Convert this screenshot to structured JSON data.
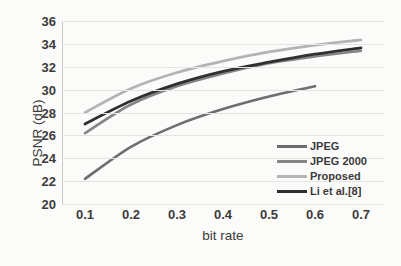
{
  "chart_data": {
    "type": "line",
    "title": "",
    "xlabel": "bit rate",
    "ylabel": "PSNR (dB)",
    "xlim": [
      0.05,
      0.75
    ],
    "ylim": [
      20,
      36
    ],
    "ytick_step": 2,
    "grid": true,
    "legend_position": "bottom-right",
    "xticks": [
      "0.1",
      "0.2",
      "0.3",
      "0.4",
      "0.5",
      "0.6",
      "0.7"
    ],
    "yticks": [
      "36",
      "34",
      "32",
      "30",
      "28",
      "26",
      "24",
      "22",
      "20"
    ],
    "x": [
      0.1,
      0.2,
      0.3,
      0.4,
      0.5,
      0.6,
      0.7
    ],
    "series": [
      {
        "name": "JPEG",
        "color": "#6e6e6e",
        "width": 2.6,
        "x": [
          0.1,
          0.2,
          0.3,
          0.4,
          0.5,
          0.6
        ],
        "values": [
          22.2,
          25.0,
          26.9,
          28.3,
          29.4,
          30.3
        ]
      },
      {
        "name": "JPEG 2000",
        "color": "#858585",
        "width": 2.6,
        "x": [
          0.1,
          0.2,
          0.3,
          0.4,
          0.5,
          0.6,
          0.7
        ],
        "values": [
          26.2,
          28.7,
          30.3,
          31.4,
          32.3,
          32.9,
          33.4
        ]
      },
      {
        "name": "Proposed",
        "color": "#b4b4b4",
        "width": 2.8,
        "x": [
          0.1,
          0.2,
          0.3,
          0.4,
          0.5,
          0.6,
          0.7
        ],
        "values": [
          28.0,
          30.1,
          31.5,
          32.5,
          33.3,
          33.9,
          34.35
        ]
      },
      {
        "name": "Li et al.[8]",
        "color": "#2f2f2f",
        "width": 2.8,
        "x": [
          0.1,
          0.2,
          0.3,
          0.4,
          0.5,
          0.6,
          0.7
        ],
        "values": [
          27.0,
          29.0,
          30.5,
          31.6,
          32.4,
          33.1,
          33.65
        ]
      }
    ]
  }
}
